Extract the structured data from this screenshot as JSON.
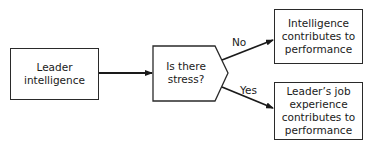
{
  "diagram": {
    "type": "flowchart",
    "nodes": [
      {
        "id": "leader_intelligence",
        "shape": "rectangle",
        "text": "Leader intelligence",
        "lines": [
          "Leader",
          "intelligence"
        ]
      },
      {
        "id": "stress",
        "shape": "decision",
        "text": "Is there stress?",
        "lines": [
          "Is there",
          "stress?"
        ]
      },
      {
        "id": "intelligence_perf",
        "shape": "rectangle",
        "text": "Intelligence contributes to performance",
        "lines": [
          "Intelligence",
          "contributes to",
          "performance"
        ]
      },
      {
        "id": "experience_perf",
        "shape": "rectangle",
        "text": "Leader's job experience contributes to performance",
        "lines": [
          "Leader’s job",
          "experience",
          "contributes to",
          "performance"
        ]
      }
    ],
    "edges": [
      {
        "from": "leader_intelligence",
        "to": "stress",
        "label": ""
      },
      {
        "from": "stress",
        "to": "intelligence_perf",
        "label": "No"
      },
      {
        "from": "stress",
        "to": "experience_perf",
        "label": "Yes"
      }
    ],
    "line_color": "#1a1a1a"
  }
}
